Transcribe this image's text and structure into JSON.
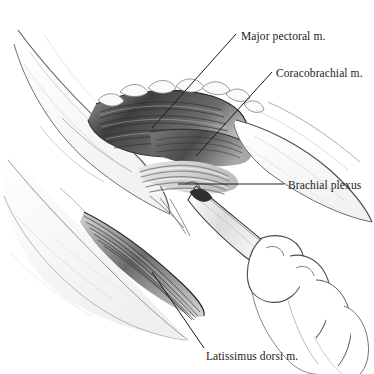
{
  "figure": {
    "kind": "surgical-anatomy-illustration",
    "background_color": "#ffffff",
    "ink_color": "#1b1b1b"
  },
  "labels": [
    {
      "id": "pec",
      "text": "Major pectoral m.",
      "x": 241,
      "y": 30,
      "leader": "diagonal-down-left"
    },
    {
      "id": "cor",
      "text": "Coracobrachial m.",
      "x": 276,
      "y": 67,
      "leader": "diagonal-down-left"
    },
    {
      "id": "plx",
      "text": "Brachial plexus",
      "x": 288,
      "y": 179,
      "leader": "horizontal-left"
    },
    {
      "id": "lat",
      "text": "Latissimus dorsi m.",
      "x": 206,
      "y": 350,
      "leader": "diagonal-up-left"
    }
  ],
  "structures": [
    {
      "name": "major-pectoral-muscle",
      "tone": "#4f4f4f"
    },
    {
      "name": "coracobrachial-muscle",
      "tone": "#6a6a6a"
    },
    {
      "name": "brachial-plexus-cords",
      "tone": "#d8d8d8"
    },
    {
      "name": "latissimus-dorsi-muscle",
      "tone": "#5a5a5a"
    },
    {
      "name": "skin-flap-retracted",
      "tone": "#fbfbfb"
    },
    {
      "name": "subcutaneous-fat",
      "tone": "#f4f4f4"
    },
    {
      "name": "surgeon-hand",
      "tone": "#ffffff"
    },
    {
      "name": "nerve-probe-instrument",
      "tone": "#efefef"
    }
  ]
}
